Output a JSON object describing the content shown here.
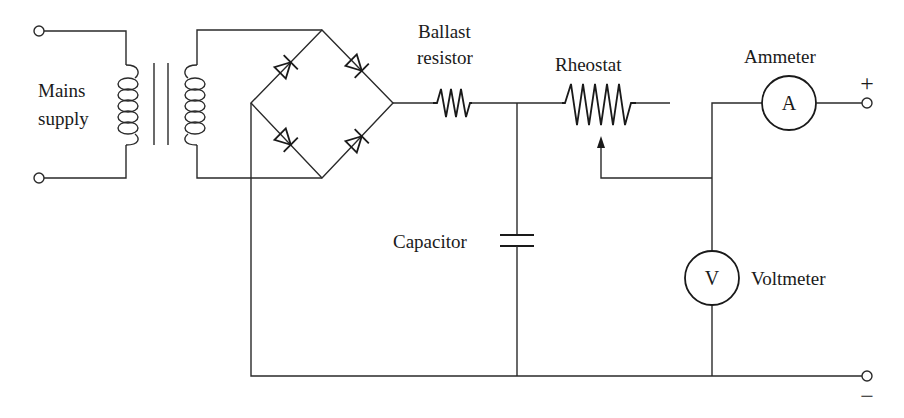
{
  "diagram": {
    "type": "circuit-schematic",
    "labels": {
      "mains_line1": "Mains",
      "mains_line2": "supply",
      "ballast_line1": "Ballast",
      "ballast_line2": "resistor",
      "rheostat": "Rheostat",
      "ammeter": "Ammeter",
      "capacitor": "Capacitor",
      "voltmeter": "Voltmeter"
    },
    "meter_symbols": {
      "ammeter": "A",
      "voltmeter": "V"
    },
    "terminals": {
      "positive": "+",
      "negative": "−"
    },
    "components": [
      "mains-supply-terminals",
      "transformer",
      "bridge-rectifier",
      "ballast-resistor",
      "capacitor",
      "rheostat",
      "ammeter",
      "voltmeter",
      "output-terminals"
    ],
    "colors": {
      "ink": "#1a1a1a",
      "background": "#ffffff"
    }
  }
}
